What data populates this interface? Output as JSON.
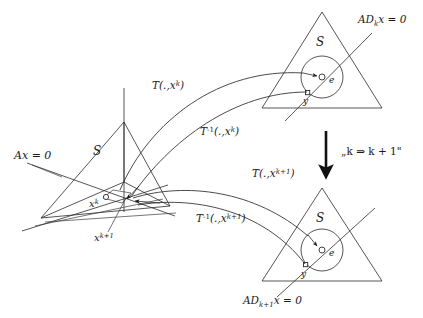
{
  "figure": {
    "background_color": "#ffffff",
    "line_color": "#2b2b2b",
    "text_color": "#1a1a1a"
  },
  "labels": {
    "ax_zero": "Ax = 0",
    "s_left": "S",
    "s_top": "S",
    "s_bottom": "S",
    "x_k_base": "x",
    "x_k_sup": "k",
    "x_k1_base": "x",
    "x_k1_sup": "k+1",
    "ad_k_prefix": "AD",
    "ad_k_sub": "k",
    "ad_k_suffix": "x = 0",
    "ad_k1_prefix": "AD",
    "ad_k1_sub": "k+1",
    "ad_k1_suffix": "x = 0",
    "e_top": "e",
    "y_top": "y",
    "e_bottom": "e",
    "y_bottom": "y",
    "t_fwd_k_base": "T(.,",
    "t_fwd_k_arg": "x",
    "t_fwd_k_sup": "k",
    "t_fwd_k_close": ")",
    "t_inv_k_base": "T",
    "t_inv_k_exp": "-1",
    "t_inv_k_args": "(.,",
    "t_inv_k_arg": "x",
    "t_inv_k_sup": "k",
    "t_inv_k_close": ")",
    "t_fwd_k1_base": "T(.,",
    "t_fwd_k1_arg": "x",
    "t_fwd_k1_sup": "k+1",
    "t_fwd_k1_close": ")",
    "t_inv_k1_base": "T",
    "t_inv_k1_exp": "-1",
    "t_inv_k1_args": "(.,",
    "t_inv_k1_arg": "x",
    "t_inv_k1_sup": "k+1",
    "t_inv_k1_close": ")",
    "iteration_note": "„k ⇒ k + 1\""
  }
}
